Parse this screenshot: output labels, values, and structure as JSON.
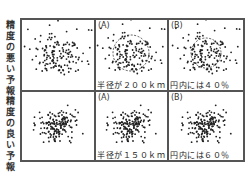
{
  "row_labels": {
    "top": [
      "精",
      "度",
      "の",
      "悪",
      "い",
      "予",
      "報"
    ],
    "bottom": [
      "精",
      "度",
      "の",
      "良",
      "い",
      "予",
      "報"
    ]
  },
  "panels": [
    {
      "row": "top",
      "col": 0,
      "tag": "",
      "caption": "",
      "circle": false,
      "spread": "wide"
    },
    {
      "row": "top",
      "col": 1,
      "tag": "(A)",
      "caption": "半径が200km",
      "circle": true,
      "spread": "wide"
    },
    {
      "row": "top",
      "col": 2,
      "tag": "(B)",
      "caption": "円内には40%",
      "circle": true,
      "spread": "wide"
    },
    {
      "row": "bottom",
      "col": 0,
      "tag": "",
      "caption": "",
      "circle": false,
      "spread": "tight"
    },
    {
      "row": "bottom",
      "col": 1,
      "tag": "(A)",
      "caption": "半径が150km",
      "circle": false,
      "spread": "tight"
    },
    {
      "row": "bottom",
      "col": 2,
      "tag": "(B)",
      "caption": "円内には60%",
      "circle": false,
      "spread": "tight"
    }
  ],
  "p0": {
    "tag": "",
    "caption": ""
  },
  "p1": {
    "tag": "(A)",
    "caption": "半径が２００ｋｍ"
  },
  "p2": {
    "tag": "(B)",
    "caption": "円内には４０％"
  },
  "p3": {
    "tag": "",
    "caption": ""
  },
  "p4": {
    "tag": "(A)",
    "caption": "半径が１５０ｋｍ"
  },
  "p5": {
    "tag": "(B)",
    "caption": "円内には６０％"
  },
  "colors": {
    "dot": "#222222",
    "border": "#555555",
    "background": "#ffffff"
  }
}
